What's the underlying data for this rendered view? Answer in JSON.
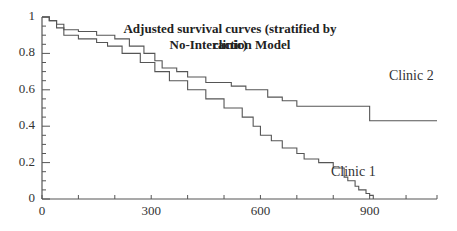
{
  "chart_data": {
    "type": "line",
    "subtype": "step (Kaplan-Meier style survival curves)",
    "title": "Adjusted survival curves (stratified by clinic)",
    "subtitle": "No-Interaction Model",
    "xlabel": "",
    "ylabel": "",
    "xlim": [
      0,
      1085
    ],
    "ylim": [
      0,
      1
    ],
    "x_ticks": [
      0,
      300,
      600,
      900
    ],
    "x_tick_labels": [
      "0",
      "300",
      "600",
      "900"
    ],
    "y_ticks": [
      0,
      0.2,
      0.4,
      0.6,
      0.8,
      1
    ],
    "y_tick_labels": [
      "0",
      "0.2",
      "0.4",
      "0.6",
      "0.8",
      "1"
    ],
    "grid": false,
    "legend": "inline labels next to curves",
    "series": [
      {
        "name": "Clinic 1",
        "x": [
          0,
          20,
          40,
          60,
          100,
          150,
          180,
          220,
          270,
          310,
          350,
          400,
          450,
          500,
          550,
          580,
          600,
          630,
          660,
          700,
          720,
          760,
          800,
          830,
          840,
          860,
          870,
          890,
          900,
          910
        ],
        "y": [
          1.0,
          0.98,
          0.94,
          0.9,
          0.88,
          0.86,
          0.84,
          0.8,
          0.75,
          0.7,
          0.65,
          0.6,
          0.55,
          0.5,
          0.45,
          0.4,
          0.35,
          0.32,
          0.28,
          0.25,
          0.22,
          0.2,
          0.17,
          0.12,
          0.1,
          0.07,
          0.05,
          0.03,
          0.02,
          0.0
        ]
      },
      {
        "name": "Clinic 2",
        "x": [
          0,
          20,
          40,
          60,
          100,
          150,
          200,
          240,
          280,
          310,
          330,
          370,
          400,
          450,
          520,
          560,
          620,
          660,
          700,
          890,
          900,
          1085
        ],
        "y": [
          1.0,
          0.98,
          0.96,
          0.93,
          0.92,
          0.9,
          0.88,
          0.84,
          0.8,
          0.76,
          0.72,
          0.7,
          0.67,
          0.64,
          0.62,
          0.6,
          0.56,
          0.54,
          0.51,
          0.51,
          0.43,
          0.43
        ]
      }
    ],
    "annotations": [
      {
        "text": "Clinic 2",
        "x": 1000,
        "y": 0.47
      },
      {
        "text": "Clinic 1",
        "x": 860,
        "y": 0.12
      }
    ]
  },
  "labels": {
    "title": "Adjusted survival curves (stratified by clinic)",
    "subtitle": "No-Interaction Model",
    "clinic1": "Clinic 1",
    "clinic2": "Clinic 2"
  }
}
